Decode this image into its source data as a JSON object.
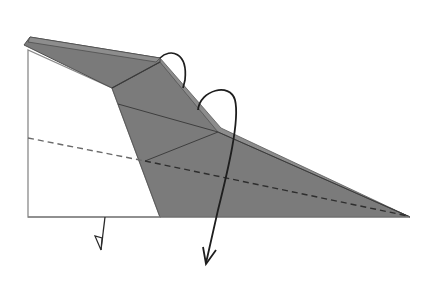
{
  "diagram": {
    "type": "origami-fold-step",
    "colors": {
      "background": "#ffffff",
      "paper_white": "#ffffff",
      "paper_colored": "#7a7a7a",
      "paper_colored_light": "#8a8a8a",
      "edge_line": "#555555",
      "crease_line": "#3a3a3a",
      "arrow": "#1e1e1e",
      "valley_dash": "#4a4a4a"
    },
    "elements": [
      {
        "name": "white-paper-flap",
        "label": "White flap (back of paper)"
      },
      {
        "name": "colored-paper-body",
        "label": "Colored folded body"
      },
      {
        "name": "valley-fold-line",
        "label": "Dashed valley fold line"
      },
      {
        "name": "small-fold-arrow",
        "label": "Fold behind arrow"
      },
      {
        "name": "curved-fold-arrow-1",
        "label": "Curved fold arrow"
      },
      {
        "name": "long-fold-arrow",
        "label": "Long fold arrow down"
      }
    ]
  }
}
